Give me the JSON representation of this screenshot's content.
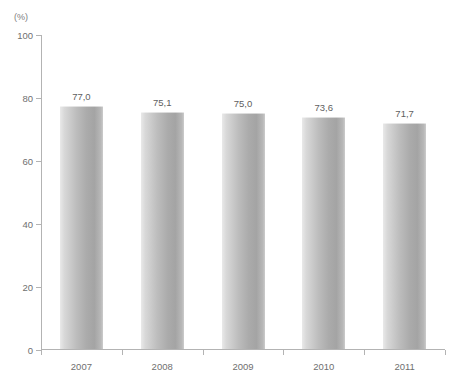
{
  "chart_data": {
    "type": "bar",
    "title": "",
    "subtitle": "",
    "xlabel": "",
    "ylabel": "",
    "unit_label": "(%)",
    "categories": [
      "2007",
      "2008",
      "2009",
      "2010",
      "2011"
    ],
    "values": [
      77.0,
      75.1,
      75.0,
      73.6,
      71.7
    ],
    "value_labels": [
      "77,0",
      "75,1",
      "75,0",
      "73,6",
      "71,7"
    ],
    "ylim": [
      0,
      100
    ],
    "yticks": [
      0,
      20,
      40,
      60,
      80,
      100
    ],
    "ytick_labels": [
      "0",
      "20",
      "40",
      "60",
      "80",
      "100"
    ],
    "grid": false,
    "legend": false,
    "legend_position": "none",
    "series": [
      {
        "name": "",
        "values": [
          77.0,
          75.1,
          75.0,
          73.6,
          71.7
        ]
      }
    ],
    "colors": {
      "bar_light": "#e9e9e9",
      "bar_mid": "#bdbdbd",
      "bar_dark": "#a4a4a4",
      "axis": "#b3b3b3",
      "text": "#6f6f6f",
      "background": "#ffffff"
    }
  },
  "footnote": {
    "text": ""
  }
}
